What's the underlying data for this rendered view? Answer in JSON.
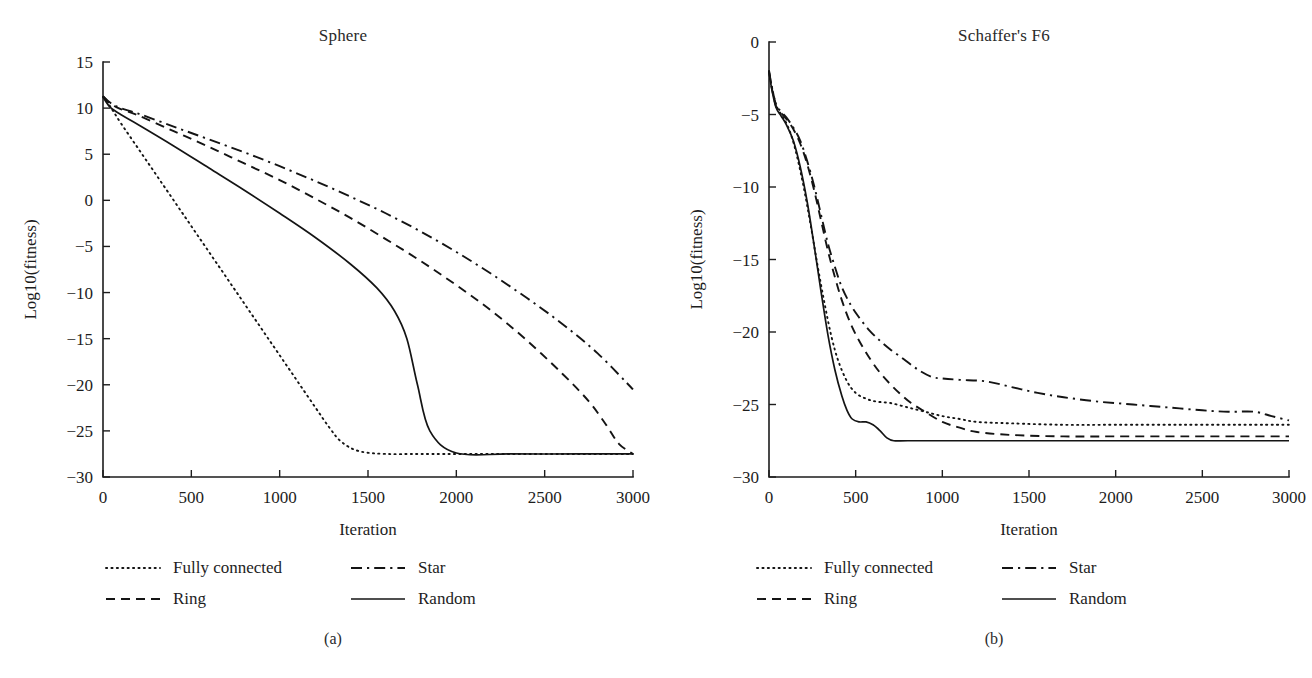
{
  "figure": {
    "panels": [
      {
        "id": "a",
        "sublabel": "(a)",
        "title": "Sphere",
        "xlabel": "Iteration",
        "ylabel": "Log10(fitness)",
        "xticks": [
          0,
          500,
          1000,
          1500,
          2000,
          2500,
          3000
        ],
        "yticks": [
          15,
          10,
          5,
          0,
          -5,
          -10,
          -15,
          -20,
          -25,
          -30
        ],
        "xlim": [
          0,
          3000
        ],
        "ylim": [
          -30,
          15
        ]
      },
      {
        "id": "b",
        "sublabel": "(b)",
        "title": "Schaffer's F6",
        "xlabel": "Iteration",
        "ylabel": "Log10(fitness)",
        "xticks": [
          0,
          500,
          1000,
          1500,
          2000,
          2500,
          3000
        ],
        "yticks": [
          0,
          -5,
          -10,
          -15,
          -20,
          -25,
          -30
        ],
        "xlim": [
          0,
          3000
        ],
        "ylim": [
          -30,
          0
        ]
      }
    ],
    "legend": {
      "items": [
        {
          "key": "fully_connected",
          "label": "Fully connected",
          "style": "dotted"
        },
        {
          "key": "star",
          "label": "Star",
          "style": "dashdot"
        },
        {
          "key": "ring",
          "label": "Ring",
          "style": "dashed"
        },
        {
          "key": "random",
          "label": "Random",
          "style": "solid"
        }
      ]
    },
    "colors": {
      "ink": "#141414",
      "axis": "#1d1d1d"
    }
  },
  "chart_data": [
    {
      "type": "line",
      "panel": "a",
      "title": "Sphere",
      "xlabel": "Iteration",
      "ylabel": "Log10(fitness)",
      "xlim": [
        0,
        3000
      ],
      "ylim": [
        -30,
        15
      ],
      "xticks": [
        0,
        500,
        1000,
        1500,
        2000,
        2500,
        3000
      ],
      "yticks": [
        15,
        10,
        5,
        0,
        -5,
        -10,
        -15,
        -20,
        -25,
        -30
      ],
      "grid": false,
      "legend_position": "below-left",
      "series": [
        {
          "name": "Fully connected",
          "style": "dotted",
          "x": [
            0,
            40,
            100,
            200,
            300,
            400,
            500,
            600,
            700,
            800,
            900,
            1000,
            1100,
            1200,
            1280,
            1350,
            1450,
            1600,
            1800,
            2100,
            2500,
            3000
          ],
          "y": [
            11.2,
            10.2,
            8.4,
            5.6,
            2.8,
            0.0,
            -2.8,
            -5.6,
            -8.4,
            -11.2,
            -14.0,
            -16.8,
            -19.6,
            -22.4,
            -24.6,
            -26.2,
            -27.2,
            -27.5,
            -27.5,
            -27.5,
            -27.5,
            -27.5
          ]
        },
        {
          "name": "Ring",
          "style": "dashed",
          "x": [
            0,
            40,
            100,
            200,
            400,
            600,
            800,
            1000,
            1200,
            1400,
            1600,
            1800,
            2000,
            2200,
            2400,
            2600,
            2750,
            2850,
            2920,
            3000
          ],
          "y": [
            11.3,
            10.5,
            9.9,
            9.2,
            7.5,
            5.8,
            4.0,
            2.2,
            0.2,
            -1.9,
            -4.2,
            -6.6,
            -9.2,
            -12.0,
            -15.2,
            -18.8,
            -21.8,
            -24.4,
            -26.4,
            -27.5
          ]
        },
        {
          "name": "Star",
          "style": "dashdot",
          "x": [
            0,
            40,
            100,
            200,
            400,
            600,
            800,
            1000,
            1200,
            1400,
            1600,
            1800,
            2000,
            2200,
            2400,
            2600,
            2800,
            3000
          ],
          "y": [
            11.3,
            10.6,
            10.0,
            9.4,
            8.0,
            6.6,
            5.2,
            3.7,
            2.1,
            0.4,
            -1.4,
            -3.4,
            -5.6,
            -8.0,
            -10.6,
            -13.4,
            -16.6,
            -20.5
          ]
        },
        {
          "name": "Random",
          "style": "solid",
          "x": [
            0,
            40,
            100,
            200,
            400,
            600,
            800,
            1000,
            1200,
            1400,
            1550,
            1650,
            1720,
            1780,
            1850,
            2000,
            2300,
            2700,
            3000
          ],
          "y": [
            11.2,
            10.1,
            9.3,
            8.2,
            5.9,
            3.5,
            1.1,
            -1.4,
            -4.0,
            -6.9,
            -9.5,
            -12.0,
            -15.0,
            -20.0,
            -25.0,
            -27.4,
            -27.5,
            -27.5,
            -27.5
          ]
        }
      ]
    },
    {
      "type": "line",
      "panel": "b",
      "title": "Schaffer's F6",
      "xlabel": "Iteration",
      "ylabel": "Log10(fitness)",
      "xlim": [
        0,
        3000
      ],
      "ylim": [
        -30,
        0
      ],
      "xticks": [
        0,
        500,
        1000,
        1500,
        2000,
        2500,
        3000
      ],
      "yticks": [
        0,
        -5,
        -10,
        -15,
        -20,
        -25,
        -30
      ],
      "grid": false,
      "legend_position": "below-left",
      "series": [
        {
          "name": "Fully connected",
          "style": "dotted",
          "x": [
            0,
            15,
            40,
            70,
            100,
            130,
            160,
            200,
            240,
            280,
            320,
            360,
            400,
            450,
            500,
            560,
            620,
            700,
            800,
            900,
            1000,
            1100,
            1200,
            1400,
            1700,
            2000,
            2400,
            2800,
            3000
          ],
          "y": [
            -2.0,
            -3.0,
            -4.3,
            -5.0,
            -5.6,
            -6.5,
            -7.8,
            -10.0,
            -12.6,
            -15.4,
            -18.0,
            -20.3,
            -22.0,
            -23.4,
            -24.2,
            -24.6,
            -24.8,
            -24.9,
            -25.2,
            -25.5,
            -25.8,
            -26.0,
            -26.2,
            -26.3,
            -26.4,
            -26.4,
            -26.4,
            -26.4,
            -26.4
          ]
        },
        {
          "name": "Ring",
          "style": "dashed",
          "x": [
            0,
            15,
            40,
            70,
            100,
            140,
            180,
            220,
            260,
            300,
            340,
            380,
            420,
            470,
            520,
            580,
            640,
            700,
            760,
            820,
            900,
            1000,
            1100,
            1200,
            1400,
            1700,
            2000,
            2400,
            2800,
            3000
          ],
          "y": [
            -2.0,
            -3.1,
            -4.4,
            -4.9,
            -5.3,
            -6.0,
            -7.0,
            -8.4,
            -10.2,
            -12.3,
            -14.4,
            -16.2,
            -17.8,
            -19.4,
            -20.6,
            -21.8,
            -22.8,
            -23.6,
            -24.3,
            -24.9,
            -25.5,
            -26.2,
            -26.6,
            -26.9,
            -27.1,
            -27.2,
            -27.2,
            -27.2,
            -27.2,
            -27.2
          ]
        },
        {
          "name": "Star",
          "style": "dashdot",
          "x": [
            0,
            15,
            40,
            70,
            100,
            140,
            180,
            220,
            260,
            300,
            340,
            380,
            420,
            470,
            520,
            580,
            640,
            700,
            780,
            860,
            940,
            1000,
            1100,
            1250,
            1400,
            1550,
            1700,
            1900,
            2100,
            2300,
            2500,
            2650,
            2800,
            2900,
            3000
          ],
          "y": [
            -2.0,
            -3.0,
            -4.3,
            -4.8,
            -5.2,
            -5.9,
            -6.8,
            -8.2,
            -9.9,
            -11.9,
            -13.9,
            -15.5,
            -16.9,
            -18.1,
            -19.0,
            -19.9,
            -20.6,
            -21.2,
            -21.9,
            -22.6,
            -23.1,
            -23.2,
            -23.3,
            -23.4,
            -23.8,
            -24.2,
            -24.5,
            -24.8,
            -25.0,
            -25.2,
            -25.4,
            -25.5,
            -25.5,
            -25.8,
            -26.1
          ]
        },
        {
          "name": "Random",
          "style": "solid",
          "x": [
            0,
            15,
            40,
            70,
            100,
            140,
            180,
            220,
            260,
            300,
            340,
            380,
            420,
            450,
            480,
            520,
            560,
            600,
            640,
            680,
            720,
            800,
            1000,
            1400,
            2000,
            2600,
            3000
          ],
          "y": [
            -2.0,
            -3.2,
            -4.5,
            -5.1,
            -5.7,
            -6.8,
            -8.6,
            -11.0,
            -14.0,
            -17.2,
            -20.2,
            -22.6,
            -24.4,
            -25.4,
            -26.0,
            -26.2,
            -26.2,
            -26.4,
            -26.8,
            -27.3,
            -27.5,
            -27.5,
            -27.5,
            -27.5,
            -27.5,
            -27.5,
            -27.5
          ]
        }
      ]
    }
  ]
}
